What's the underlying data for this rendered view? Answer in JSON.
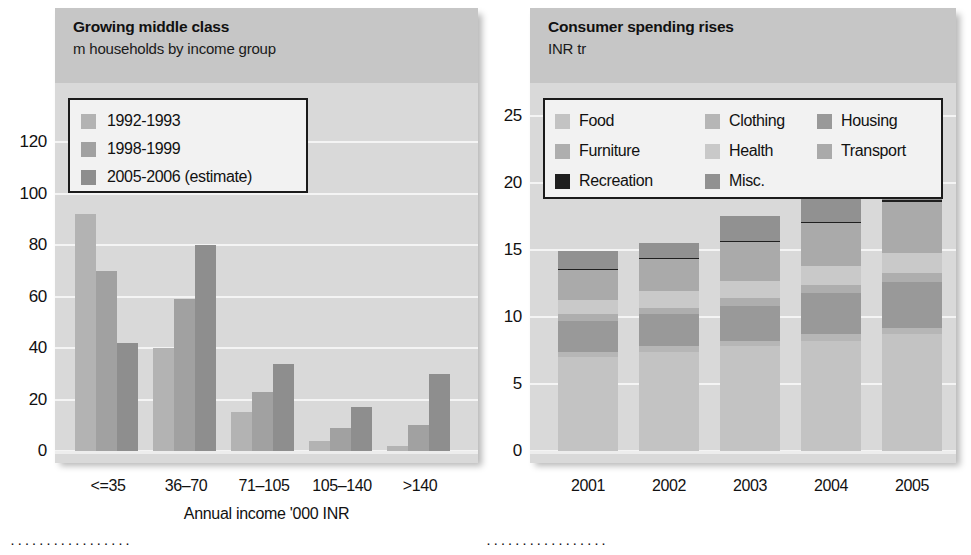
{
  "chart_data": [
    {
      "type": "bar",
      "id": "growing-middle-class",
      "title": "Growing middle class",
      "subtitle": "m households by income group",
      "xlabel": "Annual income '000 INR",
      "ylabel": "",
      "categories": [
        "<=35",
        "36–70",
        "71–105",
        "105–140",
        ">140"
      ],
      "yticks": [
        "0",
        "20",
        "40",
        "60",
        "80",
        "100",
        "120"
      ],
      "ylim": [
        0,
        140
      ],
      "grid": true,
      "legend_position": "top-left",
      "series": [
        {
          "name": "1992-1993",
          "color": "#b3b3b3",
          "values": [
            92,
            40,
            15,
            4,
            2
          ]
        },
        {
          "name": "1998-1999",
          "color": "#a1a1a1",
          "values": [
            70,
            59,
            23,
            9,
            10
          ]
        },
        {
          "name": "2005-2006 (estimate)",
          "color": "#8e8e8e",
          "values": [
            42,
            80,
            34,
            17,
            30
          ]
        }
      ]
    },
    {
      "type": "bar",
      "id": "consumer-spending-rises",
      "title": "Consumer spending rises",
      "subtitle": "INR tr",
      "xlabel": "",
      "ylabel": "",
      "stacked": true,
      "categories": [
        "2001",
        "2002",
        "2003",
        "2004",
        "2005"
      ],
      "yticks": [
        "0",
        "5",
        "10",
        "15",
        "20",
        "25"
      ],
      "ylim": [
        0,
        27
      ],
      "grid": true,
      "legend_position": "top",
      "series": [
        {
          "name": "Food",
          "color": "#c3c3c3",
          "values": [
            7.0,
            7.4,
            7.8,
            8.2,
            8.7
          ]
        },
        {
          "name": "Clothing",
          "color": "#b6b6b6",
          "values": [
            0.4,
            0.4,
            0.4,
            0.5,
            0.5
          ]
        },
        {
          "name": "Housing",
          "color": "#999999",
          "values": [
            2.3,
            2.4,
            2.6,
            3.1,
            3.4
          ]
        },
        {
          "name": "Furniture",
          "color": "#aeaeae",
          "values": [
            0.5,
            0.5,
            0.6,
            0.6,
            0.7
          ]
        },
        {
          "name": "Health",
          "color": "#c9c9c9",
          "values": [
            1.1,
            1.2,
            1.3,
            1.4,
            1.5
          ]
        },
        {
          "name": "Transport",
          "color": "#aaaaaa",
          "values": [
            2.2,
            2.4,
            2.9,
            3.2,
            3.8
          ]
        },
        {
          "name": "Recreation",
          "color": "#1f1f1f",
          "values": [
            0.1,
            0.1,
            0.1,
            0.1,
            0.1
          ]
        },
        {
          "name": "Misc.",
          "color": "#919191",
          "values": [
            1.3,
            1.1,
            1.8,
            2.0,
            2.3
          ]
        }
      ],
      "totals": [
        14.9,
        15.5,
        17.5,
        19.1,
        21.0
      ]
    }
  ],
  "left_chart": {
    "header_bg": "#c6c6c6",
    "plot_bg": "#d9d9d9",
    "gridline_color": "#f4f4f4"
  },
  "right_chart": {
    "header_bg": "#c6c6c6",
    "plot_bg": "#d9d9d9",
    "gridline_color": "#f4f4f4"
  },
  "footer": {
    "left_dots": "·················",
    "right_dots": "·················"
  }
}
